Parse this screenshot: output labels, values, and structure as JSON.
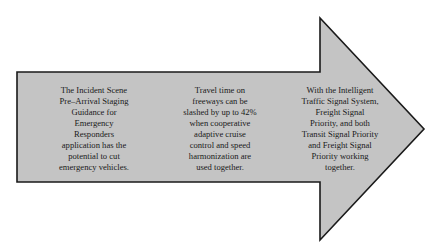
{
  "diagram": {
    "shape": "right-arrow",
    "colors": {
      "fill": "#c4c4c4",
      "stroke": "#1a1a1a",
      "background": "#ffffff",
      "text": "#1a1a1a"
    },
    "blocks": [
      {
        "text": "The Incident Scene\nPre–Arrival Staging\nGuidance for\nEmergency\nResponders\napplication has the\npotential to cut\nemergency vehicles."
      },
      {
        "text": "Travel time on\nfreeways can be\nslashed by up to 42%\nwhen cooperative\nadaptive cruise\ncontrol and speed\nharmonization are\nused together."
      },
      {
        "text": "With the Intelligent\nTraffic Signal System,\nFreight Signal\nPriority, and both\nTransit Signal Priority\nand Freight Signal\nPriority working\ntogether."
      }
    ]
  }
}
